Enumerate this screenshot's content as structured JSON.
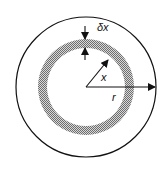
{
  "diagram": {
    "labels": {
      "thickness": "δx",
      "inner_radius": "x",
      "outer_radius": "r"
    },
    "colors": {
      "stroke": "#111111",
      "ring_fill_dark": "#6e6e6e",
      "ring_fill_light": "#d8d8d8",
      "background": "#ffffff"
    }
  }
}
